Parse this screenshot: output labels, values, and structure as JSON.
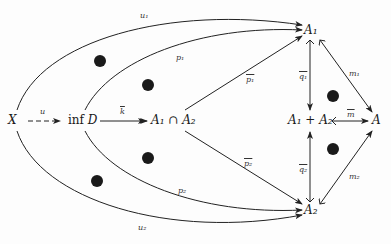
{
  "diagram": {
    "type": "commutative-diagram",
    "nodes": {
      "X": "X",
      "infD_prefix": "inf",
      "infD_var": "D",
      "A1capA2": "A₁ ∩ A₂",
      "A1": "A₁",
      "A2": "A₂",
      "A1plusA2": "A₁ + A₂",
      "A": "A"
    },
    "edges": {
      "u": "u",
      "k_bar": "k",
      "u1_top": "u₁",
      "p1_top": "p₁",
      "p1_bar": "p₁",
      "p2_bar": "p₂",
      "p2_bottom": "p₂",
      "u2_bottom": "u₂",
      "q1_bar": "q₁",
      "q2_bar": "q₂",
      "m_bar": "m",
      "m1": "m₁",
      "m2": "m₂"
    },
    "dots": 6
  }
}
